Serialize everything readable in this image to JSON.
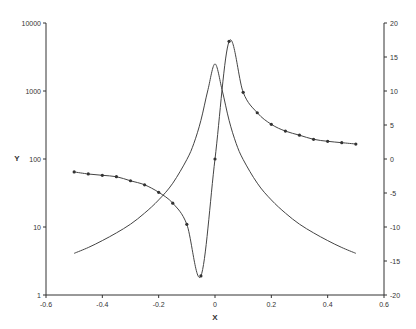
{
  "chart_data": {
    "type": "line",
    "title": "",
    "xlabel": "X",
    "ylabel": "Y",
    "xlim": [
      -0.6,
      0.6
    ],
    "xticks": [
      "-0.6",
      "-0.4",
      "-0.2",
      "0",
      "0.2",
      "0.4",
      "0.6"
    ],
    "y_left": {
      "scale": "log",
      "lim": [
        1,
        10000
      ],
      "ticks": [
        "1",
        "10",
        "100",
        "1000",
        "10000"
      ]
    },
    "y_right": {
      "scale": "linear",
      "lim": [
        -20,
        20
      ],
      "ticks": [
        "-20",
        "-15",
        "-10",
        "-5",
        "0",
        "5",
        "10",
        "15",
        "20"
      ]
    },
    "grid": false,
    "legend": null,
    "series": [
      {
        "name": "Lorentzian (left axis, log)",
        "axis": "left",
        "markers": false,
        "x": [
          -0.5,
          -0.45,
          -0.4,
          -0.35,
          -0.3,
          -0.25,
          -0.2,
          -0.15,
          -0.1,
          -0.075,
          -0.05,
          -0.025,
          0,
          0.025,
          0.05,
          0.075,
          0.1,
          0.15,
          0.2,
          0.25,
          0.3,
          0.35,
          0.4,
          0.45,
          0.5
        ],
        "values": [
          4.1,
          5.0,
          6.3,
          8.2,
          11,
          16,
          25,
          44,
          98,
          170,
          370,
          1050,
          2500,
          1050,
          370,
          170,
          98,
          44,
          25,
          16,
          11,
          8.2,
          6.3,
          5.0,
          4.1
        ]
      },
      {
        "name": "Dispersion (right axis)",
        "axis": "right",
        "markers": true,
        "x": [
          -0.5,
          -0.45,
          -0.4,
          -0.35,
          -0.3,
          -0.25,
          -0.2,
          -0.15,
          -0.1,
          -0.05,
          0,
          0.05,
          0.1,
          0.15,
          0.2,
          0.25,
          0.3,
          0.35,
          0.4,
          0.45,
          0.5
        ],
        "values": [
          -1.9,
          -2.2,
          -2.4,
          -2.6,
          -3.2,
          -3.8,
          -4.9,
          -6.5,
          -9.6,
          -17.2,
          0,
          17.3,
          9.8,
          6.8,
          5.1,
          4.1,
          3.5,
          2.9,
          2.6,
          2.4,
          2.2
        ]
      }
    ]
  }
}
